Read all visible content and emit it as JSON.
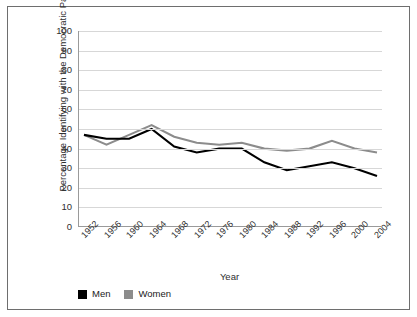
{
  "chart_data": {
    "type": "line",
    "title": "",
    "xlabel": "Year",
    "ylabel": "Percentage Identifying with the Democratic Party",
    "categories": [
      "1952",
      "1956",
      "1960",
      "1964",
      "1968",
      "1972",
      "1976",
      "1980",
      "1984",
      "1988",
      "1992",
      "1996",
      "2000",
      "2004"
    ],
    "ylim": [
      0,
      100
    ],
    "ytick_labels": [
      "0",
      "10",
      "20",
      "30",
      "40",
      "50",
      "60",
      "70",
      "80",
      "90",
      "100"
    ],
    "ytick_values": [
      0,
      10,
      20,
      30,
      40,
      50,
      60,
      70,
      80,
      90,
      100
    ],
    "grid": "horizontal",
    "legend_position": "bottom-left",
    "series": [
      {
        "name": "Men",
        "color": "#000000",
        "values": [
          47,
          45,
          45,
          50,
          41,
          38,
          40,
          40,
          33,
          29,
          31,
          33,
          30,
          26
        ]
      },
      {
        "name": "Women",
        "color": "#8c8c8c",
        "values": [
          47,
          42,
          47,
          52,
          46,
          43,
          42,
          43,
          40,
          39,
          40,
          44,
          40,
          38
        ]
      }
    ]
  },
  "legend": {
    "items": [
      {
        "label": "Men",
        "color": "#000000"
      },
      {
        "label": "Women",
        "color": "#8c8c8c"
      }
    ]
  },
  "axes": {
    "y_title": "Percentage Identifying with the Democratic Party",
    "x_title": "Year"
  }
}
